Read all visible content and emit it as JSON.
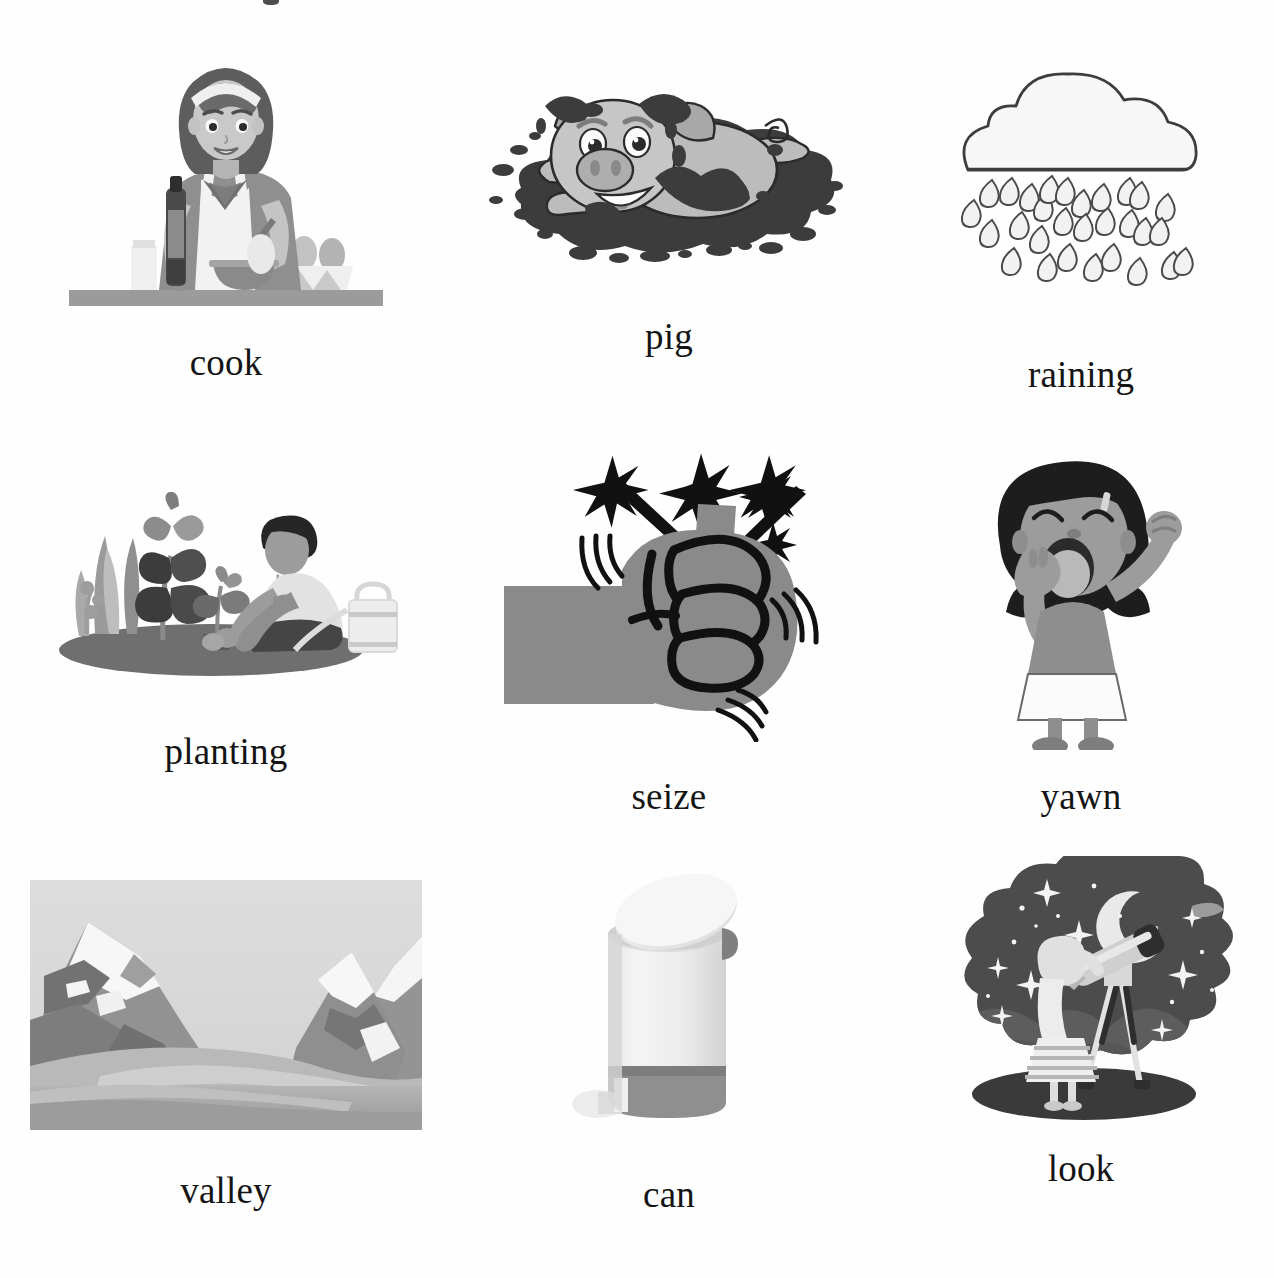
{
  "page": {
    "kind": "vocabulary-picture-worksheet",
    "background_color": "#ffffff",
    "text_color": "#141414",
    "columns": 3,
    "rows": 3
  },
  "items": [
    {
      "id": "cook",
      "label": "cook",
      "illustration": "woman-cooking-at-counter",
      "description": "Woman with bob haircut and headband wearing an apron, holding a bottle, mixing in a bowl on a counter with an egg carton, apple and jar",
      "style": "flat-vector-grayscale",
      "colors": {
        "hair": "#6e6e6e",
        "skin": "#c9c9c9",
        "apron": "#f0f0f0",
        "dress": "#8f8f8f",
        "counter": "#9a9a9a"
      }
    },
    {
      "id": "pig",
      "label": "pig",
      "illustration": "pig-lying-in-mud-puddle",
      "description": "Cartoon pig with floppy ears and curly tail lying in a splattered mud puddle with mud spots on its back",
      "style": "cartoon-line-art-grayscale",
      "colors": {
        "body": "#b9b9b9",
        "mud": "#3a3a3a",
        "outline": "#2b2b2b"
      }
    },
    {
      "id": "raining",
      "label": "raining",
      "illustration": "cloud-with-raindrops",
      "description": "Outlined cloud with rows of falling teardrop-shaped raindrops below it",
      "style": "outline-line-art",
      "colors": {
        "cloud_fill": "#f7f7f7",
        "outline": "#3d3d3d",
        "drop_fill": "#f2f2f2"
      }
    },
    {
      "id": "planting",
      "label": "planting",
      "illustration": "person-planting-seedling-in-garden",
      "description": "Person kneeling on a dark soil mound planting a small seedling beside leafy plants and grass, with a watering can at right",
      "style": "flat-vector-grayscale",
      "colors": {
        "soil": "#6b6b6b",
        "leaves_dark": "#3c3c3c",
        "leaves_mid": "#8a8a8a",
        "shirt": "#e6e6e6",
        "hair": "#2a2a2a"
      }
    },
    {
      "id": "seize",
      "label": "seize",
      "illustration": "clenched-fist-grabbing-with-sparks",
      "description": "Gray forearm and clenched fist gripping an object, with black spark bursts radiating upward and motion lines around the knuckles",
      "style": "bold-outline-grayscale",
      "colors": {
        "hand": "#8a8a8a",
        "outline": "#111111",
        "sparks": "#111111"
      }
    },
    {
      "id": "yawn",
      "label": "yawn",
      "illustration": "girl-yawning-and-stretching",
      "description": "Girl with dark hair, eyes closed, covering her open mouth with one hand while stretching her other arm up in a fist",
      "style": "cartoon-grayscale",
      "colors": {
        "hair": "#1d1d1d",
        "skin": "#9c9c9c",
        "top": "#8e8e8e",
        "skirt": "#fbfbfb"
      }
    },
    {
      "id": "valley",
      "label": "valley",
      "illustration": "photo-of-snow-capped-mountain-valley",
      "description": "Grayscale photograph of a valley between two snow-capped mountain peaks with a flat plain in the foreground",
      "style": "photograph-grayscale",
      "colors": {
        "sky": "#d6d6d6",
        "snow": "#f6f6f6",
        "rock": "#8e8e8e",
        "foreground": "#9f9f9f"
      }
    },
    {
      "id": "can",
      "label": "can",
      "illustration": "step-pedal-trash-can",
      "description": "White cylindrical step trash can with a tilted lid, dark base band and a foot pedal at the bottom left",
      "style": "product-photo-grayscale",
      "colors": {
        "body": "#efefef",
        "shadow": "#d8d8d8",
        "band": "#8f8f8f",
        "pedal": "#e8e8e8"
      }
    },
    {
      "id": "look",
      "label": "look",
      "illustration": "girl-looking-through-telescope-at-night-sky",
      "description": "Girl in a striped skirt standing on a dark hill looking through a tripod telescope at a starry night sky with a crescent moon",
      "style": "flat-vector-grayscale",
      "colors": {
        "sky": "#4a4a4a",
        "stars": "#f4f4f4",
        "moon": "#e9e9e9",
        "hills": "#5f5f5f",
        "ground": "#3a3a3a",
        "girl": "#d7d7d7"
      }
    }
  ]
}
